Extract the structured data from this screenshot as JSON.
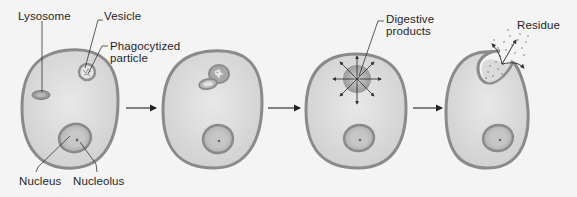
{
  "diagram": {
    "type": "process-sequence",
    "stages": [
      {
        "index": 1,
        "label_keys": [
          "lysosome",
          "vesicle",
          "phagocytized_particle",
          "nucleus",
          "nucleolus"
        ]
      },
      {
        "index": 2,
        "label_keys": []
      },
      {
        "index": 3,
        "label_keys": [
          "digestive_products"
        ]
      },
      {
        "index": 4,
        "label_keys": [
          "residue"
        ]
      }
    ],
    "arrows": [
      {
        "from": 1,
        "to": 2
      },
      {
        "from": 2,
        "to": 3
      },
      {
        "from": 3,
        "to": 4
      }
    ]
  },
  "labels": {
    "lysosome": "Lysosome",
    "vesicle": "Vesicle",
    "phagocytized_particle": "Phagocytized\nparticle",
    "nucleus": "Nucleus",
    "nucleolus": "Nucleolus",
    "digestive_products": "Digestive\nproducts",
    "residue": "Residue"
  },
  "colors": {
    "background": "#f4f4f4",
    "cell_membrane": "#8a8a8a",
    "cytoplasm": "#dcdcdc",
    "organelle": "#8e8e8e",
    "text": "#1e1e1e"
  }
}
